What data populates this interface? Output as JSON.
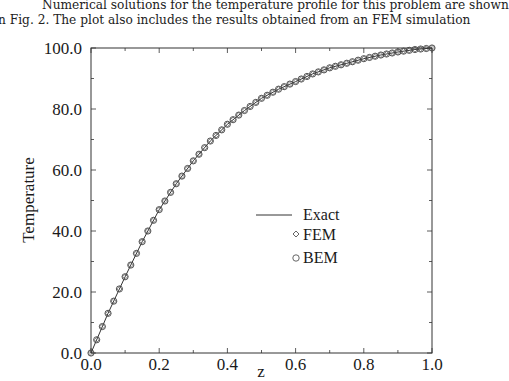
{
  "paragraph": {
    "line1": "Numerical solutions for the temperature profile for this problem are shown",
    "line2": "n Fig. 2. The plot also includes the results obtained from an FEM simulation"
  },
  "chart_data": {
    "type": "line",
    "title": "",
    "xlabel": "z",
    "ylabel": "Temperature",
    "xlim": [
      0.0,
      1.0
    ],
    "ylim": [
      0.0,
      100.0
    ],
    "x_ticks": [
      "0.0",
      "0.2",
      "0.4",
      "0.6",
      "0.8",
      "1.0"
    ],
    "y_ticks": [
      "0.0",
      "20.0",
      "40.0",
      "60.0",
      "80.0",
      "100.0"
    ],
    "grid": false,
    "legend_position": "center-right",
    "x": [
      0.0,
      0.05,
      0.1,
      0.15,
      0.2,
      0.25,
      0.3,
      0.35,
      0.4,
      0.45,
      0.5,
      0.55,
      0.6,
      0.65,
      0.7,
      0.75,
      0.8,
      0.85,
      0.9,
      0.95,
      1.0
    ],
    "series": [
      {
        "name": "Exact",
        "style": "line",
        "values": [
          0,
          13,
          25,
          36.5,
          47,
          55.5,
          63,
          69.5,
          75,
          79.5,
          83.5,
          86.5,
          89,
          91.5,
          93.5,
          95,
          96.5,
          97.7,
          98.7,
          99.5,
          100
        ]
      },
      {
        "name": "FEM",
        "style": "diamond",
        "values": [
          0,
          13,
          25,
          36.5,
          47,
          55.5,
          63,
          69.5,
          75,
          79.5,
          83.5,
          86.5,
          89,
          91.5,
          93.5,
          95,
          96.5,
          97.7,
          98.7,
          99.5,
          100
        ]
      },
      {
        "name": "BEM",
        "style": "circle",
        "values": [
          0,
          13,
          25,
          36.5,
          47,
          55.5,
          63,
          69.5,
          75,
          79.5,
          83.5,
          86.5,
          89,
          91.5,
          93.5,
          95,
          96.5,
          97.7,
          98.7,
          99.5,
          100
        ]
      }
    ],
    "legend": [
      "Exact",
      "FEM",
      "BEM"
    ]
  }
}
